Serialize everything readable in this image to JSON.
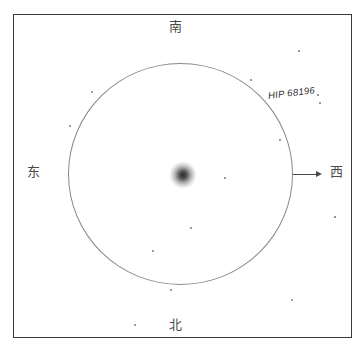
{
  "header": {
    "clipped_text": "▫▫▫ ▫▫▫▫ ▫▫▫ ▫▫"
  },
  "compass": {
    "south_label": "南",
    "north_label": "北",
    "east_label": "东",
    "west_label": "西"
  },
  "annotations": {
    "star_label": "HIP 68196"
  },
  "chart_data": {
    "type": "scatter",
    "title": "",
    "xlabel": "",
    "ylabel": "",
    "fov_circle": {
      "center_x": 181,
      "center_y": 174,
      "radius_x": 112,
      "radius_y": 111,
      "stroke": "#8a8a8a"
    },
    "target": {
      "label": "HIP 68196",
      "center_x": 183,
      "center_y": 175,
      "appearance": "fuzzy-blurred-disk",
      "size": 26
    },
    "direction_arrow": {
      "points_to": "西",
      "from_x": 293,
      "from_y": 174,
      "to_x": 322,
      "to_y": 174
    },
    "orientation": {
      "top": "南",
      "bottom": "北",
      "left": "东",
      "right": "西"
    },
    "field_stars": [
      {
        "x": 92,
        "y": 92,
        "size": 1.3
      },
      {
        "x": 70,
        "y": 126,
        "size": 1.1
      },
      {
        "x": 299,
        "y": 51,
        "size": 1.6
      },
      {
        "x": 251,
        "y": 80,
        "size": 1.2
      },
      {
        "x": 320,
        "y": 103,
        "size": 1.2
      },
      {
        "x": 280,
        "y": 140,
        "size": 1.3
      },
      {
        "x": 225,
        "y": 178,
        "size": 1.6
      },
      {
        "x": 191,
        "y": 228,
        "size": 1.5
      },
      {
        "x": 153,
        "y": 251,
        "size": 1.3
      },
      {
        "x": 171,
        "y": 290,
        "size": 1.4
      },
      {
        "x": 335,
        "y": 217,
        "size": 1.7
      },
      {
        "x": 292,
        "y": 300,
        "size": 1.3
      },
      {
        "x": 135,
        "y": 325,
        "size": 1.4
      },
      {
        "x": 318,
        "y": 95,
        "size": 1.2
      }
    ],
    "colors": {
      "frame": "#3a3a3a",
      "circle": "#8a8a8a",
      "star": "#5a5a5a",
      "label_text": "#2e2e2e",
      "direction_text": "#4a4a4a",
      "background": "#ffffff"
    }
  }
}
